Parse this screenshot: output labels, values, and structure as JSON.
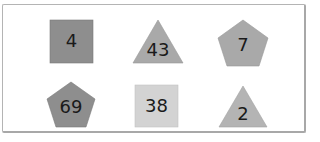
{
  "figure": {
    "border_color": "#b0b0b0",
    "background": "#ffffff"
  },
  "shapes": [
    {
      "id": "s1",
      "type": "square",
      "label": "4",
      "fill": "#8e8e8e",
      "row": 1,
      "col": 1
    },
    {
      "id": "s2",
      "type": "triangle",
      "label": "43",
      "fill": "#a9a9a9",
      "row": 1,
      "col": 2
    },
    {
      "id": "s3",
      "type": "pentagon",
      "label": "7",
      "fill": "#a9a9a9",
      "row": 1,
      "col": 3
    },
    {
      "id": "s4",
      "type": "pentagon",
      "label": "69",
      "fill": "#8e8e8e",
      "row": 2,
      "col": 1
    },
    {
      "id": "s5",
      "type": "square",
      "label": "38",
      "fill": "#d3d3d3",
      "row": 2,
      "col": 2
    },
    {
      "id": "s6",
      "type": "triangle",
      "label": "2",
      "fill": "#b4b4b4",
      "row": 2,
      "col": 3
    }
  ]
}
